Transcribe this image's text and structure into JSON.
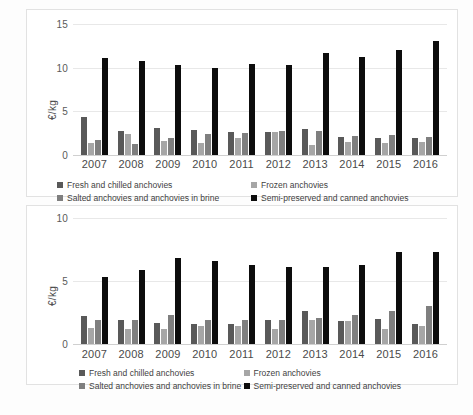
{
  "chart_data": [
    {
      "id": "top",
      "type": "bar",
      "title": "",
      "xlabel": "",
      "ylabel": "€/kg",
      "ylim": [
        0,
        15
      ],
      "yticks": [
        0,
        5,
        10,
        15
      ],
      "grid": true,
      "legend_position": "bottom",
      "categories": [
        "2007",
        "2008",
        "2009",
        "2010",
        "2011",
        "2012",
        "2013",
        "2014",
        "2015",
        "2016"
      ],
      "series": [
        {
          "name": "Fresh and chilled anchovies",
          "color": "#595959",
          "values": [
            4.4,
            2.8,
            3.1,
            2.9,
            2.6,
            2.6,
            3.0,
            2.1,
            1.9,
            2.0
          ]
        },
        {
          "name": "Frozen anchovies",
          "color": "#a6a6a6",
          "values": [
            1.4,
            2.4,
            1.6,
            1.4,
            1.9,
            2.6,
            1.1,
            1.5,
            1.4,
            1.5
          ]
        },
        {
          "name": "Salted anchovies and anchovies in brine",
          "color": "#7f7f7f",
          "values": [
            1.7,
            1.3,
            2.0,
            2.4,
            2.5,
            2.7,
            2.7,
            2.2,
            2.3,
            2.1
          ]
        },
        {
          "name": "Semi-preserved and canned anchovies",
          "color": "#0d0d0d",
          "values": [
            11.1,
            10.8,
            10.3,
            10.0,
            10.4,
            10.3,
            11.7,
            11.2,
            12.0,
            13.0
          ]
        }
      ]
    },
    {
      "id": "bottom",
      "type": "bar",
      "title": "",
      "xlabel": "",
      "ylabel": "€/kg",
      "ylim": [
        0,
        10
      ],
      "yticks": [
        0,
        5,
        10
      ],
      "grid": true,
      "legend_position": "bottom",
      "categories": [
        "2007",
        "2008",
        "2009",
        "2010",
        "2011",
        "2012",
        "2013",
        "2014",
        "2015",
        "2016"
      ],
      "series": [
        {
          "name": "Fresh and chilled anchovies",
          "color": "#595959",
          "values": [
            2.2,
            1.9,
            1.7,
            1.6,
            1.6,
            1.9,
            2.6,
            1.8,
            2.0,
            1.6
          ]
        },
        {
          "name": "Frozen anchovies",
          "color": "#a6a6a6",
          "values": [
            1.3,
            1.2,
            1.2,
            1.4,
            1.4,
            1.2,
            1.9,
            1.8,
            1.2,
            1.4
          ]
        },
        {
          "name": "Salted anchovies and anchovies in brine",
          "color": "#7f7f7f",
          "values": [
            1.9,
            1.9,
            2.3,
            1.9,
            1.9,
            1.9,
            2.1,
            2.3,
            2.6,
            3.0
          ]
        },
        {
          "name": "Semi-preserved and canned anchovies",
          "color": "#0d0d0d",
          "values": [
            5.3,
            5.9,
            6.8,
            6.6,
            6.3,
            6.1,
            6.1,
            6.3,
            7.3,
            7.3
          ]
        }
      ]
    }
  ]
}
